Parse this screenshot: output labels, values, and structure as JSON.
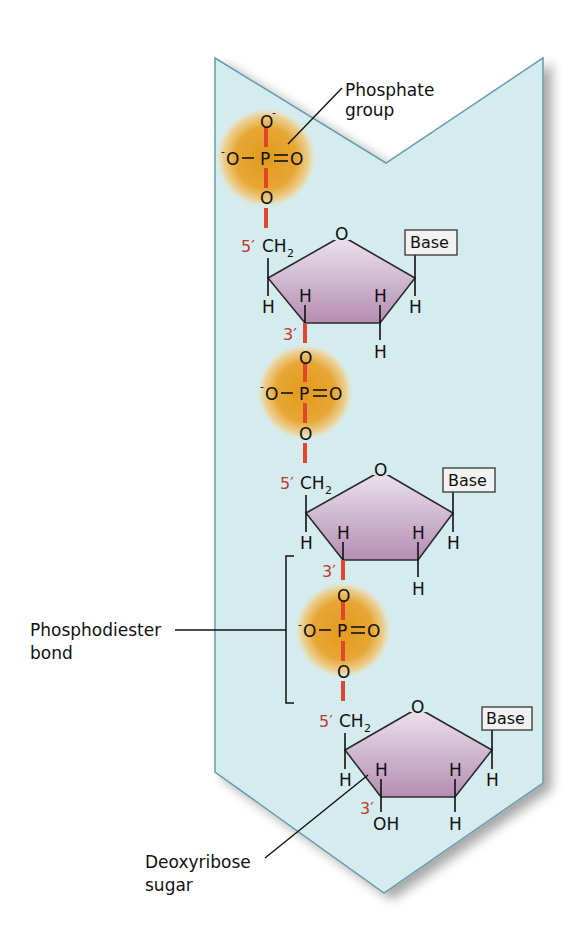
{
  "diagram": {
    "type": "chemical-structure",
    "colors": {
      "band_fill": "#d5ecee",
      "band_stroke": "#6a9aab",
      "phosphate_glow": "#e3a12a",
      "sugar_top": "#ebe2ec",
      "sugar_bottom": "#b58db3",
      "bond_red": "#e2452d",
      "prime_label": "#c0392b",
      "line": "#111111"
    },
    "labels": {
      "phosphate_group": [
        "Phosphate",
        "group"
      ],
      "phosphodiester_bond": [
        "Phosphodiester",
        "bond"
      ],
      "deoxyribose_sugar": [
        "Deoxyribose",
        "sugar"
      ]
    },
    "phosphate": {
      "P": "P",
      "O": "O",
      "minus": "-"
    },
    "sugar": {
      "ring_O": "O",
      "CH": "CH",
      "sub2": "2",
      "H": "H",
      "OH": "OH",
      "five_prime": "5′",
      "three_prime": "3′"
    },
    "base_label": "Base",
    "nucleotides": [
      {
        "index": 1,
        "base": "Base",
        "terminal_phosphate": true
      },
      {
        "index": 2,
        "base": "Base"
      },
      {
        "index": 3,
        "base": "Base",
        "three_prime_end": "OH"
      }
    ]
  }
}
